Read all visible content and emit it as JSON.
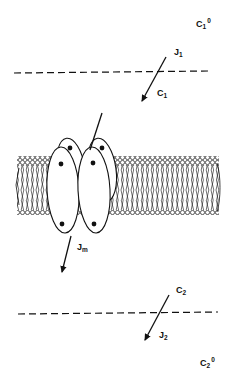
{
  "diagram": {
    "type": "membrane-transport-schematic",
    "bulk_top": {
      "concentration_label": "C",
      "concentration_sub": "1",
      "concentration_sup": "0"
    },
    "boundary_top": {
      "flux_label": "J",
      "flux_sub": "1",
      "interface_conc_label": "C",
      "interface_conc_sub": "1"
    },
    "membrane": {
      "flux_label": "J",
      "flux_sub": "m",
      "components": [
        "lipid-bilayer",
        "transport-protein-complex"
      ]
    },
    "boundary_bottom": {
      "interface_conc_label": "C",
      "interface_conc_sub": "2",
      "flux_label": "J",
      "flux_sub": "2"
    },
    "bulk_bottom": {
      "concentration_label": "C",
      "concentration_sub": "2",
      "concentration_sup": "0"
    },
    "colors": {
      "ink": "#111111",
      "background": "#ffffff"
    }
  }
}
